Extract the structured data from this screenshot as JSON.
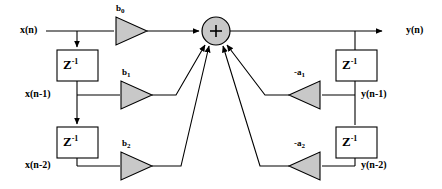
{
  "diagram": {
    "type": "signal-flow-diagram",
    "colors": {
      "line": "#000000",
      "fill_shape": "#c8c8c8",
      "block_fill": "#ffffff",
      "background": "#ffffff"
    },
    "input": {
      "label": "x(n)"
    },
    "output": {
      "label": "y(n)"
    },
    "summer": {
      "symbol": "+",
      "name": "summing-junction"
    },
    "feedforward": {
      "taps": [
        {
          "signal": "x(n)",
          "gain": "b",
          "gain_sub": "0",
          "delay": null
        },
        {
          "signal": "x(n-1)",
          "gain": "b",
          "gain_sub": "1",
          "delay": "Z",
          "delay_exp": "-1"
        },
        {
          "signal": "x(n-2)",
          "gain": "b",
          "gain_sub": "2",
          "delay": "Z",
          "delay_exp": "-1"
        }
      ]
    },
    "feedback": {
      "taps": [
        {
          "signal": "y(n-1)",
          "gain": "-a",
          "gain_sub": "1",
          "delay": "Z",
          "delay_exp": "-1"
        },
        {
          "signal": "y(n-2)",
          "gain": "-a",
          "gain_sub": "2",
          "delay": "Z",
          "delay_exp": "-1"
        }
      ]
    },
    "delay_blocks": [
      {
        "base": "Z",
        "exp": "-1",
        "name": "delay-x-1"
      },
      {
        "base": "Z",
        "exp": "-1",
        "name": "delay-x-2"
      },
      {
        "base": "Z",
        "exp": "-1",
        "name": "delay-y-1"
      },
      {
        "base": "Z",
        "exp": "-1",
        "name": "delay-y-2"
      }
    ]
  }
}
